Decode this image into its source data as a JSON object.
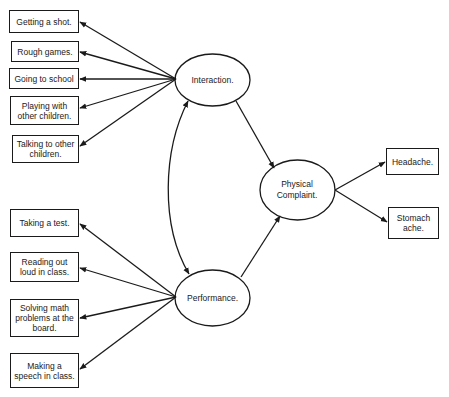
{
  "diagram": {
    "type": "path-model",
    "latent_nodes": [
      {
        "id": "interaction",
        "label": "Interaction."
      },
      {
        "id": "performance",
        "label": "Performance."
      },
      {
        "id": "physical_complaint",
        "label": "Physical Complaint."
      }
    ],
    "interaction_indicators": [
      {
        "id": "ind1",
        "label": "Getting a shot."
      },
      {
        "id": "ind2",
        "label": "Rough games."
      },
      {
        "id": "ind3",
        "label": "Going to school"
      },
      {
        "id": "ind4",
        "label": "Playing with other children."
      },
      {
        "id": "ind5",
        "label": "Talking to other children."
      }
    ],
    "performance_indicators": [
      {
        "id": "ind6",
        "label": "Taking a test."
      },
      {
        "id": "ind7",
        "label": "Reading out loud in class."
      },
      {
        "id": "ind8",
        "label": "Solving math problems at the board."
      },
      {
        "id": "ind9",
        "label": "Making a speech in class."
      }
    ],
    "physical_indicators": [
      {
        "id": "ind10",
        "label": "Headache."
      },
      {
        "id": "ind11",
        "label": "Stomach ache."
      }
    ],
    "edges": [
      {
        "from": "interaction",
        "to": "ind1"
      },
      {
        "from": "interaction",
        "to": "ind2"
      },
      {
        "from": "interaction",
        "to": "ind3"
      },
      {
        "from": "interaction",
        "to": "ind4"
      },
      {
        "from": "interaction",
        "to": "ind5"
      },
      {
        "from": "performance",
        "to": "ind6"
      },
      {
        "from": "performance",
        "to": "ind7"
      },
      {
        "from": "performance",
        "to": "ind8"
      },
      {
        "from": "performance",
        "to": "ind9"
      },
      {
        "from": "interaction",
        "to": "physical_complaint"
      },
      {
        "from": "performance",
        "to": "physical_complaint"
      },
      {
        "from": "physical_complaint",
        "to": "ind10"
      },
      {
        "from": "physical_complaint",
        "to": "ind11"
      },
      {
        "from": "interaction",
        "to": "performance",
        "bidirectional": true,
        "curved": true
      }
    ]
  }
}
